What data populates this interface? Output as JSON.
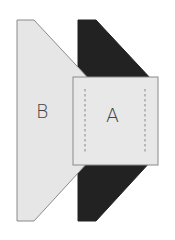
{
  "diagram": {
    "labels": {
      "b": "B",
      "a": "A"
    },
    "colors": {
      "light_fill": "#e6e6e6",
      "dark_fill": "#222222",
      "stroke": "#888888",
      "background": "#ffffff"
    },
    "shapes": [
      {
        "id": "B",
        "type": "hexagon",
        "fill": "light_fill"
      },
      {
        "id": "dark",
        "type": "hexagon",
        "fill": "dark_fill"
      },
      {
        "id": "A",
        "type": "square-with-dashed-lines",
        "fill": "light_fill"
      }
    ]
  }
}
